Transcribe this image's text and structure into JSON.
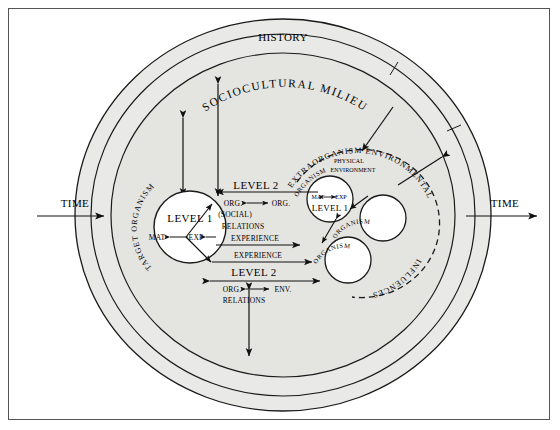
{
  "figure": {
    "type": "conceptual-diagram",
    "title_top": "HISTORY",
    "axis_left_label": "TIME",
    "axis_right_label": "TIME",
    "bands": {
      "outer_ring_label": "SOCIOCULTURAL MILIEU",
      "outer_ring_fill": "#e9e9e7",
      "inner_field_fill": "#e4e4e1",
      "stroke": "#1a1a1a"
    },
    "domains": {
      "target_organism": {
        "curved_label": "TARGET ORGANISM",
        "core_label": "LEVEL 1",
        "core_left_term": "MAT",
        "core_right_term": "EXP"
      },
      "extraorganism": {
        "curved_label_outer": "EXTRAORGANISM ENVIRONMENTAL",
        "curved_label_outer_2": "INFLUENCES",
        "curved_label_inner": "ORGANISM",
        "physical_line_1": "PHYSICAL",
        "physical_line_2": "ENVIRONMENT",
        "core_label": "LEVEL 1",
        "core_left_term": "MAT",
        "core_right_term": "EXP",
        "satellite_1_label": "ORGANISM",
        "satellite_2_label": "ORGANISM"
      }
    },
    "linkages": [
      {
        "id": "level2-social",
        "heading": "LEVEL 2",
        "left_term": "ORG.",
        "right_term": "ORG.",
        "qualifier": "(SOCIAL)",
        "relation_word": "RELATIONS",
        "channel": "EXPERIENCE"
      },
      {
        "id": "experience-return",
        "channel": "EXPERIENCE"
      },
      {
        "id": "level2-env",
        "heading": "LEVEL 2",
        "left_term": "ORG.",
        "right_term": "ENV.",
        "relation_word": "RELATIONS"
      }
    ],
    "arrows": {
      "sociocultural_down_count": 3,
      "sociocultural_into_extra_count": 2,
      "bottom_vertical_double": true,
      "time_direction": "left-to-right"
    }
  }
}
